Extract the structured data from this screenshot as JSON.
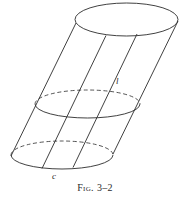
{
  "figure": {
    "caption_prefix": "Fig.",
    "caption_number": "3–2",
    "caption_full": "Fig. 3–2",
    "labels": {
      "generator_label": "l",
      "directrix_label": "c"
    },
    "colors": {
      "background": "#ffffff",
      "stroke": "#2b2b2b",
      "text": "#2b2b2b"
    },
    "geometry": {
      "type": "oblique-cylinder",
      "ellipses": [
        {
          "name": "top-ellipse",
          "cx": 126.5,
          "cy": 19.5,
          "rx": 51.5,
          "ry": 16.5,
          "back_arc_style": "solid"
        },
        {
          "name": "middle-ellipse",
          "cx": 87.5,
          "cy": 104.0,
          "rx": 52.5,
          "ry": 14.0,
          "back_arc_style": "dashed"
        },
        {
          "name": "bottom-ellipse",
          "cx": 62.0,
          "cy": 155.0,
          "rx": 51.0,
          "ry": 14.0,
          "back_arc_style": "dashed"
        }
      ],
      "generators": [
        {
          "name": "generator-left-outline",
          "x1": 76,
          "y1": 23,
          "x2": 11,
          "y2": 156
        },
        {
          "name": "generator-inner-1",
          "x1": 106,
          "y1": 35,
          "x2": 42,
          "y2": 168
        },
        {
          "name": "generator-inner-2",
          "x1": 137,
          "y1": 34,
          "x2": 73,
          "y2": 167
        },
        {
          "name": "generator-right-outline",
          "x1": 178,
          "y1": 21,
          "x2": 113,
          "y2": 154
        }
      ]
    }
  }
}
